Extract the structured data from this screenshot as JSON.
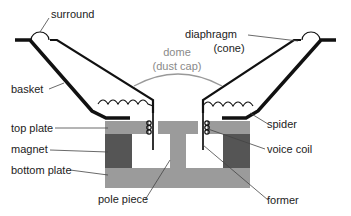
{
  "diagram": {
    "labels": {
      "surround": "surround",
      "diaphragm_line1": "diaphragm",
      "diaphragm_line2": "(cone)",
      "dome_line1": "dome",
      "dome_line2": "(dust cap)",
      "basket": "basket",
      "spider": "spider",
      "top_plate": "top plate",
      "magnet": "magnet",
      "bottom_plate": "bottom plate",
      "voice_coil": "voice coil",
      "pole_piece": "pole piece",
      "former": "former"
    },
    "colors": {
      "plate": "#9b9b9b",
      "magnet": "#555555",
      "outline": "#111111",
      "dome": "#999999",
      "leader": "#444444"
    }
  }
}
